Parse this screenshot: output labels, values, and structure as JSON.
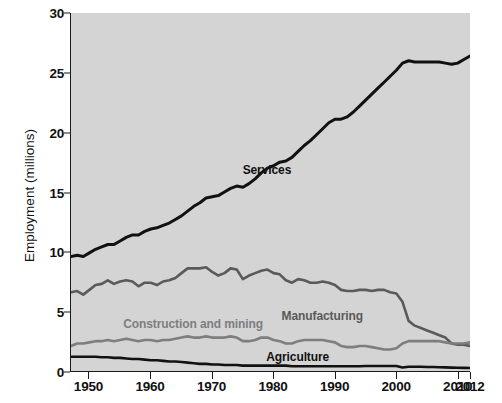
{
  "chart_data": {
    "type": "line",
    "title": "",
    "subtitle": "",
    "xlabel": "",
    "ylabel": "Employment (millions)",
    "xlim": [
      1947,
      2012
    ],
    "ylim": [
      0,
      30
    ],
    "xticks": [
      1950,
      1960,
      1970,
      1980,
      1990,
      2000,
      2010,
      2012
    ],
    "xticklabels": [
      "1950",
      "1960",
      "1970",
      "1980",
      "1990",
      "2000",
      "2010",
      "2012"
    ],
    "yticks": [
      0,
      5,
      10,
      15,
      20,
      25,
      30
    ],
    "yticklabels": [
      "0",
      "5",
      "10",
      "15",
      "20",
      "25",
      "30"
    ],
    "grid": false,
    "legend_position": "inline-annotations",
    "plot_background": "#d4d4d4",
    "figure_background": "#ffffff",
    "series": [
      {
        "name": "Services",
        "color": "#111111",
        "width": 3.0,
        "label_x": 1979,
        "label_y": 16.9,
        "label_color": "#111111",
        "x": [
          1947,
          1948,
          1949,
          1950,
          1951,
          1952,
          1953,
          1954,
          1955,
          1956,
          1957,
          1958,
          1959,
          1960,
          1961,
          1962,
          1963,
          1964,
          1965,
          1966,
          1967,
          1968,
          1969,
          1970,
          1971,
          1972,
          1973,
          1974,
          1975,
          1976,
          1977,
          1978,
          1979,
          1980,
          1981,
          1982,
          1983,
          1984,
          1985,
          1986,
          1987,
          1988,
          1989,
          1990,
          1991,
          1992,
          1993,
          1994,
          1995,
          1996,
          1997,
          1998,
          1999,
          2000,
          2001,
          2002,
          2003,
          2004,
          2005,
          2006,
          2007,
          2008,
          2009,
          2010,
          2011,
          2012
        ],
        "y": [
          9.6,
          9.7,
          9.6,
          9.9,
          10.2,
          10.4,
          10.6,
          10.6,
          10.9,
          11.2,
          11.4,
          11.4,
          11.7,
          11.9,
          12.0,
          12.2,
          12.4,
          12.7,
          13.0,
          13.4,
          13.8,
          14.1,
          14.5,
          14.6,
          14.7,
          15.0,
          15.3,
          15.5,
          15.4,
          15.7,
          16.1,
          16.6,
          17.0,
          17.2,
          17.5,
          17.6,
          17.9,
          18.4,
          18.9,
          19.3,
          19.8,
          20.3,
          20.8,
          21.1,
          21.1,
          21.3,
          21.7,
          22.2,
          22.7,
          23.2,
          23.7,
          24.2,
          24.7,
          25.2,
          25.8,
          26.0,
          25.9,
          25.9,
          25.9,
          25.9,
          25.9,
          25.8,
          25.7,
          25.8,
          26.1,
          26.4
        ]
      },
      {
        "name": "Manufacturing",
        "color": "#5a5a5a",
        "width": 2.6,
        "label_x": 1988,
        "label_y": 4.7,
        "label_color": "#5a5a5a",
        "x": [
          1947,
          1948,
          1949,
          1950,
          1951,
          1952,
          1953,
          1954,
          1955,
          1956,
          1957,
          1958,
          1959,
          1960,
          1961,
          1962,
          1963,
          1964,
          1965,
          1966,
          1967,
          1968,
          1969,
          1970,
          1971,
          1972,
          1973,
          1974,
          1975,
          1976,
          1977,
          1978,
          1979,
          1980,
          1981,
          1982,
          1983,
          1984,
          1985,
          1986,
          1987,
          1988,
          1989,
          1990,
          1991,
          1992,
          1993,
          1994,
          1995,
          1996,
          1997,
          1998,
          1999,
          2000,
          2001,
          2002,
          2003,
          2004,
          2005,
          2006,
          2007,
          2008,
          2009,
          2010,
          2011,
          2012
        ],
        "y": [
          6.6,
          6.7,
          6.4,
          6.8,
          7.2,
          7.3,
          7.6,
          7.3,
          7.5,
          7.6,
          7.5,
          7.1,
          7.4,
          7.4,
          7.2,
          7.5,
          7.6,
          7.8,
          8.2,
          8.6,
          8.6,
          8.6,
          8.7,
          8.3,
          8.0,
          8.2,
          8.6,
          8.5,
          7.7,
          8.0,
          8.2,
          8.4,
          8.5,
          8.2,
          8.1,
          7.6,
          7.4,
          7.7,
          7.6,
          7.4,
          7.4,
          7.5,
          7.4,
          7.2,
          6.8,
          6.7,
          6.7,
          6.8,
          6.8,
          6.7,
          6.8,
          6.8,
          6.6,
          6.5,
          5.8,
          4.2,
          3.8,
          3.6,
          3.4,
          3.2,
          3.0,
          2.8,
          2.3,
          2.2,
          2.2,
          2.1
        ]
      },
      {
        "name": "Construction and mining",
        "color": "#7e7e7e",
        "width": 2.6,
        "label_x": 1967,
        "label_y": 4.0,
        "label_color": "#7e7e7e",
        "x": [
          1947,
          1948,
          1949,
          1950,
          1951,
          1952,
          1953,
          1954,
          1955,
          1956,
          1957,
          1958,
          1959,
          1960,
          1961,
          1962,
          1963,
          1964,
          1965,
          1966,
          1967,
          1968,
          1969,
          1970,
          1971,
          1972,
          1973,
          1974,
          1975,
          1976,
          1977,
          1978,
          1979,
          1980,
          1981,
          1982,
          1983,
          1984,
          1985,
          1986,
          1987,
          1988,
          1989,
          1990,
          1991,
          1992,
          1993,
          1994,
          1995,
          1996,
          1997,
          1998,
          1999,
          2000,
          2001,
          2002,
          2003,
          2004,
          2005,
          2006,
          2007,
          2008,
          2009,
          2010,
          2011,
          2012
        ],
        "y": [
          2.1,
          2.3,
          2.3,
          2.4,
          2.5,
          2.5,
          2.6,
          2.5,
          2.6,
          2.7,
          2.6,
          2.5,
          2.6,
          2.6,
          2.5,
          2.6,
          2.6,
          2.7,
          2.8,
          2.9,
          2.8,
          2.8,
          2.9,
          2.8,
          2.8,
          2.8,
          2.9,
          2.8,
          2.5,
          2.5,
          2.6,
          2.8,
          2.8,
          2.6,
          2.5,
          2.3,
          2.3,
          2.5,
          2.6,
          2.6,
          2.6,
          2.6,
          2.5,
          2.4,
          2.1,
          2.0,
          2.0,
          2.1,
          2.1,
          2.0,
          1.9,
          1.8,
          1.8,
          1.9,
          2.3,
          2.5,
          2.5,
          2.5,
          2.5,
          2.5,
          2.5,
          2.4,
          2.3,
          2.3,
          2.3,
          2.4
        ]
      },
      {
        "name": "Agriculture",
        "color": "#111111",
        "width": 2.6,
        "label_x": 1984,
        "label_y": 1.25,
        "label_color": "#111111",
        "x": [
          1947,
          1948,
          1949,
          1950,
          1951,
          1952,
          1953,
          1954,
          1955,
          1956,
          1957,
          1958,
          1959,
          1960,
          1961,
          1962,
          1963,
          1964,
          1965,
          1966,
          1967,
          1968,
          1969,
          1970,
          1971,
          1972,
          1973,
          1974,
          1975,
          1976,
          1977,
          1978,
          1979,
          1980,
          1981,
          1982,
          1983,
          1984,
          1985,
          1986,
          1987,
          1988,
          1989,
          1990,
          1991,
          1992,
          1993,
          1994,
          1995,
          1996,
          1997,
          1998,
          1999,
          2000,
          2001,
          2002,
          2003,
          2004,
          2005,
          2006,
          2007,
          2008,
          2009,
          2010,
          2011,
          2012
        ],
        "y": [
          1.2,
          1.2,
          1.2,
          1.2,
          1.2,
          1.15,
          1.15,
          1.1,
          1.1,
          1.05,
          1.0,
          1.0,
          0.95,
          0.9,
          0.9,
          0.85,
          0.8,
          0.8,
          0.75,
          0.7,
          0.65,
          0.6,
          0.6,
          0.55,
          0.55,
          0.5,
          0.5,
          0.5,
          0.45,
          0.45,
          0.45,
          0.45,
          0.45,
          0.45,
          0.45,
          0.45,
          0.4,
          0.4,
          0.4,
          0.4,
          0.4,
          0.4,
          0.4,
          0.4,
          0.4,
          0.4,
          0.4,
          0.4,
          0.42,
          0.42,
          0.42,
          0.42,
          0.42,
          0.42,
          0.3,
          0.35,
          0.35,
          0.35,
          0.33,
          0.33,
          0.32,
          0.3,
          0.28,
          0.27,
          0.26,
          0.25
        ]
      }
    ]
  }
}
